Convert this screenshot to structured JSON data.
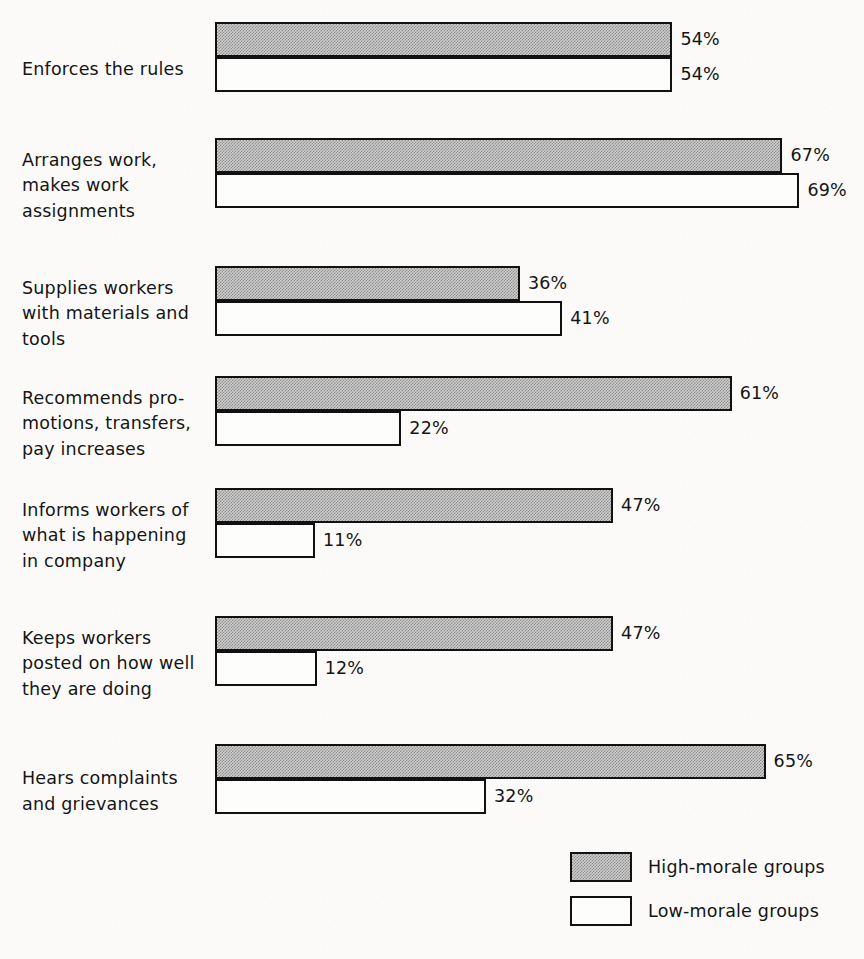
{
  "chart_data": {
    "type": "bar",
    "orientation": "horizontal",
    "title": "",
    "subtitle": "",
    "xlabel": "",
    "ylabel": "",
    "xlim": [
      0,
      100
    ],
    "grid": false,
    "value_suffix": "%",
    "legend_position": "bottom-right",
    "categories": [
      "Enforces the rules",
      "Arranges work,\nmakes work\nassignments",
      "Supplies workers\nwith materials and\ntools",
      "Recommends pro-\nmotions, transfers,\npay increases",
      "Informs workers of\nwhat is happening\nin company",
      "Keeps workers\nposted on how well\nthey are doing",
      "Hears complaints\nand grievances"
    ],
    "series": [
      {
        "name": "High-morale groups",
        "key": "high",
        "color": "#a8a8a8",
        "values": [
          54,
          67,
          36,
          61,
          47,
          47,
          65
        ],
        "labels": [
          "54%",
          "67%",
          "36%",
          "61%",
          "47%",
          "47%",
          "65%"
        ]
      },
      {
        "name": "Low-morale groups",
        "key": "low",
        "color": "#ffffff",
        "values": [
          54,
          69,
          41,
          22,
          11,
          12,
          32
        ],
        "labels": [
          "54%",
          "69%",
          "41%",
          "22%",
          "11%",
          "12%",
          "32%"
        ]
      }
    ]
  },
  "legend": {
    "items": [
      {
        "label": "High-morale groups",
        "swatch": "high"
      },
      {
        "label": "Low-morale groups",
        "swatch": "low"
      }
    ]
  },
  "layout": {
    "bar_origin_x": 215,
    "px_per_percent": 8.47,
    "min_bar_px": 100,
    "group_tops": [
      22,
      138,
      266,
      376,
      488,
      616,
      744
    ]
  }
}
